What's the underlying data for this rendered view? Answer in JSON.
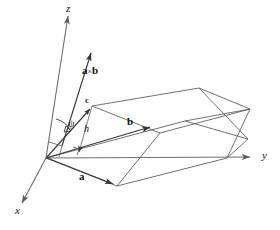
{
  "figure": {
    "background_color": "#ffffff",
    "line_color": "#585858",
    "axis_color": "#6e6e6e",
    "text_color": "#121212"
  },
  "axes": [
    {
      "id": "z",
      "label": "z",
      "direction": "up",
      "label_x": 66,
      "label_y": 4
    },
    {
      "id": "y",
      "label": "y",
      "direction": "right",
      "label_x": 263,
      "label_y": 151
    },
    {
      "id": "x",
      "label": "x",
      "direction": "down-left",
      "label_x": 17,
      "label_y": 208
    }
  ],
  "vectors": [
    {
      "id": "cross",
      "label_a": "a",
      "label_cross": "×",
      "label_b": "b",
      "label_x": 84,
      "label_y": 62
    },
    {
      "id": "c",
      "label": "c",
      "label_x": 86,
      "label_y": 98
    },
    {
      "id": "b",
      "label": "b",
      "label_x": 128,
      "label_y": 118
    },
    {
      "id": "a",
      "label": "a",
      "label_x": 80,
      "label_y": 173
    }
  ],
  "annotations": [
    {
      "id": "height",
      "label": "h",
      "label_x": 84,
      "label_y": 126,
      "kind": "height-segment"
    },
    {
      "id": "angle",
      "label": "ψ",
      "label_x": 70,
      "label_y": 121,
      "kind": "angle-psi"
    },
    {
      "id": "right-angle",
      "label": "",
      "kind": "right-angle-marker"
    }
  ],
  "geometry": {
    "origin": {
      "x": 46,
      "y": 158
    },
    "z_tip": {
      "x": 68,
      "y": 10
    },
    "y_tip": {
      "x": 258,
      "y": 157
    },
    "x_tip": {
      "x": 18,
      "y": 207
    },
    "cross_tip": {
      "x": 92,
      "y": 48
    },
    "c_tip": {
      "x": 92,
      "y": 106
    },
    "b_tip": {
      "x": 155,
      "y": 128
    },
    "a_tip": {
      "x": 117,
      "y": 186
    }
  }
}
